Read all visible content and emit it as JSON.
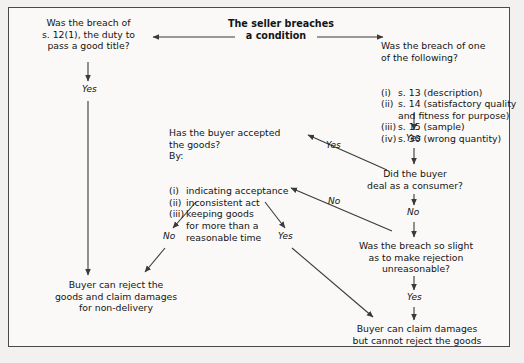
{
  "diagram": {
    "title_node": "The seller breaches\na condition",
    "nodes": {
      "q_title_12": "Was the breach of\ns. 12(1), the duty to\npass a good title?",
      "q_one_of_following_head": "Was the breach of one\nof the following?",
      "q_one_of_following_items": [
        {
          "marker": "(i)",
          "text": "s. 13 (description)"
        },
        {
          "marker": "(ii)",
          "text": "s. 14 (satisfactory quality"
        },
        {
          "marker": "",
          "text": "and fitness for purpose)"
        },
        {
          "marker": "(iii)",
          "text": "s. 15 (sample)"
        },
        {
          "marker": "(iv)",
          "text": "s. 30 (wrong quantity)"
        }
      ],
      "q_accepted_head": "Has the buyer accepted\nthe goods?\nBy:",
      "q_accepted_items": [
        {
          "marker": "(i)",
          "text": "indicating acceptance"
        },
        {
          "marker": "(ii)",
          "text": "inconsistent act"
        },
        {
          "marker": "(iii)",
          "text": "keeping goods"
        },
        {
          "marker": "",
          "text": "for more than a"
        },
        {
          "marker": "",
          "text": "reasonable time"
        }
      ],
      "q_consumer": "Did the buyer\ndeal as a consumer?",
      "q_slight": "Was the breach so slight\nas to make rejection\nunreasonable?",
      "outcome_reject": "Buyer can reject the\ngoods and claim damages\nfor non-delivery",
      "outcome_damages": "Buyer can claim damages\nbut cannot reject the goods"
    },
    "edge_labels": {
      "left_yes": "Yes",
      "right_yes_down": "Yes",
      "consumer_yes": "Yes",
      "consumer_no": "No",
      "slight_no": "No",
      "slight_yes": "Yes",
      "accepted_no": "No",
      "accepted_yes": "Yes"
    },
    "colors": {
      "line": "#3a3a3a",
      "text": "#141414",
      "border": "#4a4a4a",
      "page_background": "#f2f1ef",
      "frame_background": "#faf9f7"
    }
  }
}
